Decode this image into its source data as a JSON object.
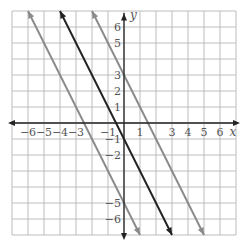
{
  "chart_data": {
    "type": "line",
    "title": "",
    "xlabel": "x",
    "ylabel": "y",
    "xlim": [
      -7,
      7
    ],
    "ylim": [
      -7,
      7
    ],
    "grid": true,
    "x_ticks": [
      "-6",
      "-5",
      "-4",
      "-3",
      "-1",
      "1",
      "3",
      "4",
      "5",
      "6"
    ],
    "y_ticks": [
      "6",
      "5",
      "3",
      "2",
      "1",
      "-1",
      "-2",
      "-5",
      "-6"
    ],
    "series": [
      {
        "name": "y = -2x - 5",
        "slope": -2,
        "intercept": -5,
        "color": "#8a8a8a",
        "x": [
          -6,
          1
        ],
        "y": [
          7,
          -7
        ]
      },
      {
        "name": "y = -2x - 1",
        "slope": -2,
        "intercept": -1,
        "color": "#222222",
        "x": [
          -4,
          3
        ],
        "y": [
          7,
          -7
        ]
      },
      {
        "name": "y = -2x + 3",
        "slope": -2,
        "intercept": 3,
        "color": "#8a8a8a",
        "x": [
          -2,
          5
        ],
        "y": [
          7,
          -7
        ]
      }
    ]
  },
  "colors": {
    "grid": "#bdbdbd",
    "axis": "#222222",
    "background": "#ffffff"
  }
}
